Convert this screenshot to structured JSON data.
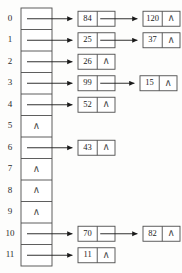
{
  "diagram": {
    "null_marker": "∧",
    "colors": {
      "stroke": "#4d4d4d",
      "line": "#1a1a1a",
      "text": "#1c1c1c",
      "background": "#fdfdfc"
    },
    "table": {
      "slot_count": 12,
      "left": 21,
      "right": 52,
      "top": 8,
      "bottom": 266
    },
    "slots": [
      {
        "index": "0",
        "empty": false,
        "chain": [
          "84",
          "120"
        ]
      },
      {
        "index": "1",
        "empty": false,
        "chain": [
          "25",
          "37"
        ]
      },
      {
        "index": "2",
        "empty": false,
        "chain": [
          "26"
        ]
      },
      {
        "index": "3",
        "empty": false,
        "chain": [
          "99",
          "15"
        ]
      },
      {
        "index": "4",
        "empty": false,
        "chain": [
          "52"
        ]
      },
      {
        "index": "5",
        "empty": true,
        "chain": []
      },
      {
        "index": "6",
        "empty": false,
        "chain": [
          "43"
        ]
      },
      {
        "index": "7",
        "empty": true,
        "chain": []
      },
      {
        "index": "8",
        "empty": true,
        "chain": []
      },
      {
        "index": "9",
        "empty": true,
        "chain": []
      },
      {
        "index": "10",
        "empty": false,
        "chain": [
          "70",
          "82"
        ]
      },
      {
        "index": "11",
        "empty": false,
        "chain": [
          "11"
        ]
      }
    ],
    "layout": {
      "index_label_x": 10,
      "row_top": 8,
      "row_height": 21.5,
      "node_level1_x": 78,
      "node_level2_x_default": 143,
      "node_level2_x_rows": {
        "3": 140,
        "10": 143
      },
      "node_width": 37,
      "node_height": 15,
      "cell_split_ratio": 0.52
    }
  }
}
